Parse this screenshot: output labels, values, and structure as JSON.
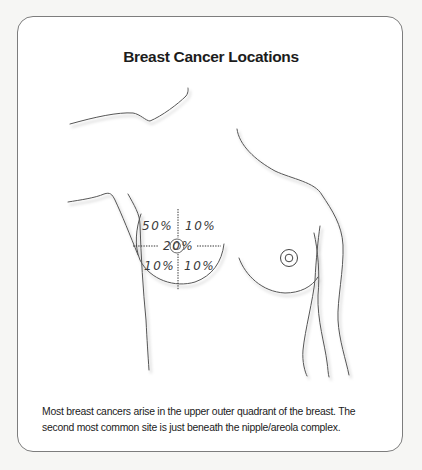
{
  "figure": {
    "title": "Breast Cancer Locations",
    "caption_lines": [
      "Most breast cancers arise in the upper outer quadrant of the breast. The",
      "second most common site is just beneath the nipple/areola complex."
    ],
    "quadrants": {
      "upper_outer": "50%",
      "upper_inner": "10%",
      "central": "20%",
      "lower_outer": "10%",
      "lower_inner": "10%"
    },
    "colors": {
      "outline": "#555555",
      "shadow": "#c8c8c8",
      "frame": "#7d7d7d",
      "text": "#1b1b1b"
    }
  }
}
